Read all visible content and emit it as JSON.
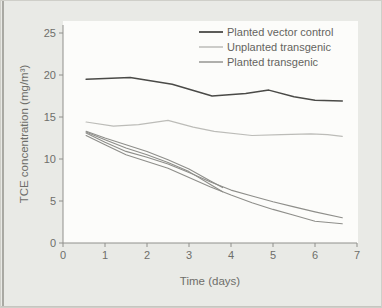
{
  "figure": {
    "background": "#e9eae6",
    "plot_background": "#fcfcfa",
    "scan_edge_color": "#a9a9a3"
  },
  "chart_data": {
    "type": "line",
    "title": "",
    "xlabel": "Time (days)",
    "ylabel": "TCE concentration (mg/m³)",
    "xlim": [
      0,
      7
    ],
    "ylim": [
      0,
      25
    ],
    "xticks": [
      0,
      1,
      2,
      3,
      4,
      5,
      6,
      7
    ],
    "yticks": [
      0,
      5,
      10,
      15,
      20,
      25
    ],
    "grid": false,
    "legend_position": "top-right-inside",
    "axis_color": "#90908c",
    "tick_label_color": "#6e6e6a",
    "legend_text_color": "#646460",
    "series": [
      {
        "name": "Planted vector control",
        "color": "#4a4a47",
        "width": 1.5,
        "lines": [
          {
            "x": [
              0.55,
              1.6,
              2.6,
              3.55,
              4.35,
              4.9,
              5.5,
              6.0,
              6.65
            ],
            "y": [
              19.5,
              19.7,
              18.9,
              17.5,
              17.8,
              18.2,
              17.4,
              17.0,
              16.9
            ]
          }
        ]
      },
      {
        "name": "Unplanted transgenic",
        "color": "#bcbcb8",
        "width": 1.2,
        "lines": [
          {
            "x": [
              0.55,
              1.2,
              1.8,
              2.5,
              3.1,
              3.6,
              4.5,
              5.2,
              5.9,
              6.3,
              6.65
            ],
            "y": [
              14.4,
              13.9,
              14.1,
              14.6,
              13.8,
              13.3,
              12.8,
              12.9,
              13.0,
              12.9,
              12.7
            ]
          }
        ]
      },
      {
        "name": "Planted transgenic",
        "color": "#8e8e8a",
        "width": 1.1,
        "lines": [
          {
            "x": [
              0.55,
              1.0,
              1.5,
              2.0,
              2.5,
              3.0,
              3.5,
              3.8
            ],
            "y": [
              13.3,
              12.5,
              11.7,
              10.9,
              9.9,
              8.8,
              7.4,
              6.6
            ]
          },
          {
            "x": [
              0.55,
              1.0,
              1.5,
              2.0,
              2.5,
              3.0,
              3.5,
              3.8
            ],
            "y": [
              13.2,
              12.3,
              11.3,
              10.5,
              9.6,
              8.5,
              7.0,
              6.1
            ]
          },
          {
            "x": [
              0.55,
              1.0,
              1.5,
              2.0,
              2.5,
              3.0,
              3.5,
              4.0,
              4.5,
              5.0,
              5.5,
              6.0,
              6.65
            ],
            "y": [
              13.1,
              12.0,
              10.9,
              10.2,
              9.4,
              8.4,
              7.3,
              6.3,
              5.6,
              4.9,
              4.3,
              3.7,
              3.0
            ]
          },
          {
            "x": [
              0.55,
              1.0,
              1.5,
              2.0,
              2.5,
              3.0,
              3.5,
              4.0,
              4.5,
              5.0,
              5.5,
              6.0,
              6.65
            ],
            "y": [
              12.8,
              11.7,
              10.5,
              9.7,
              8.9,
              7.8,
              6.7,
              5.7,
              4.8,
              4.0,
              3.3,
              2.6,
              2.3
            ]
          }
        ]
      }
    ]
  }
}
